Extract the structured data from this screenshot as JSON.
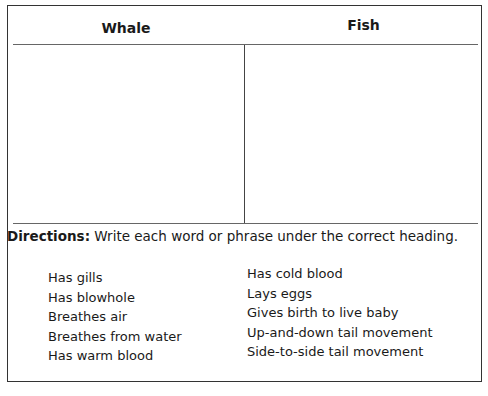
{
  "table": {
    "headers": [
      "Whale",
      "Fish"
    ]
  },
  "directions": {
    "label": "Directions:",
    "text": "Write each word or phrase under the correct heading."
  },
  "phrases": {
    "left": [
      "Has gills",
      "Has blowhole",
      "Breathes air",
      "Breathes from water",
      "Has warm blood"
    ],
    "right": [
      "Has cold blood",
      "Lays eggs",
      "Gives birth to live baby",
      "Up-and-down tail movement",
      "Side-to-side tail movement"
    ]
  }
}
